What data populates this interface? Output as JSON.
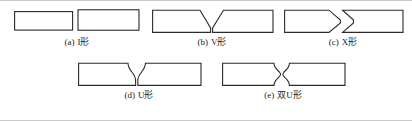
{
  "figure": {
    "title": "",
    "background_color": "#ffffff",
    "line_color": "#2b2b2b",
    "frame_color": "#c9c9c9",
    "caption_color": "#1a1a1a",
    "layout": {
      "rows": 2,
      "row1_items": 3,
      "row2_items": 2
    }
  },
  "items": [
    {
      "id": "i",
      "tag": "(a)",
      "label": "I形",
      "caption": "(a) I形",
      "shape": "two-plain-rectangles-with-square-butt-gap",
      "groove": "I",
      "icon_name": "weld-joint-i-groove-icon"
    },
    {
      "id": "v",
      "tag": "(b)",
      "label": "V形",
      "caption": "(b) V形",
      "shape": "two-plates-single-top-bevel-forming-v-groove",
      "groove": "V",
      "icon_name": "weld-joint-v-groove-icon"
    },
    {
      "id": "x",
      "tag": "(c)",
      "label": "X形",
      "caption": "(c) X形",
      "shape": "two-plates-double-bevel-top-and-bottom-forming-x-groove",
      "groove": "X",
      "icon_name": "weld-joint-x-groove-icon"
    },
    {
      "id": "u",
      "tag": "(d)",
      "label": "U形",
      "caption": "(d) U形",
      "shape": "two-plates-curved-concave-single-u-groove",
      "groove": "U",
      "icon_name": "weld-joint-u-groove-icon"
    },
    {
      "id": "uu",
      "tag": "(e)",
      "label": "双U形",
      "caption": "(e) 双U形",
      "shape": "two-plates-curved-concave-top-and-bottom-double-u-groove",
      "groove": "double-U",
      "icon_name": "weld-joint-double-u-groove-icon"
    }
  ]
}
